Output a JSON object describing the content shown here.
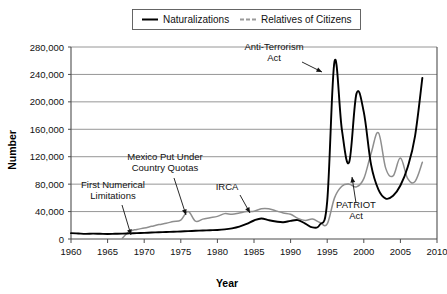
{
  "chart_data": {
    "type": "line",
    "title": "",
    "xlabel": "Year",
    "ylabel": "Number",
    "xlim": [
      1960,
      2010
    ],
    "ylim": [
      0,
      280000
    ],
    "xticks": [
      1960,
      1965,
      1970,
      1975,
      1980,
      1985,
      1990,
      1995,
      2000,
      2005,
      2010
    ],
    "xtick_labels": [
      "1960",
      "1965",
      "1970",
      "1975",
      "1980",
      "1985",
      "1990",
      "1995",
      "2000",
      "2005",
      "2010"
    ],
    "yticks": [
      0,
      40000,
      80000,
      120000,
      160000,
      200000,
      240000,
      280000
    ],
    "ytick_labels": [
      "0",
      "40,000",
      "80,000",
      "120,000",
      "160,000",
      "200,000",
      "240,000",
      "280,000"
    ],
    "grid": true,
    "legend_position": "top-center",
    "series": [
      {
        "name": "Naturalizations",
        "color": "#000000",
        "style": "solid",
        "x": [
          1960,
          1961,
          1962,
          1963,
          1964,
          1965,
          1966,
          1967,
          1968,
          1969,
          1970,
          1971,
          1972,
          1973,
          1974,
          1975,
          1976,
          1977,
          1978,
          1979,
          1980,
          1981,
          1982,
          1983,
          1984,
          1985,
          1986,
          1987,
          1988,
          1989,
          1990,
          1991,
          1992,
          1993,
          1994,
          1995,
          1996,
          1997,
          1998,
          1999,
          2000,
          2001,
          2002,
          2003,
          2004,
          2005,
          2006,
          2007,
          2008
        ],
        "values": [
          8500,
          8000,
          7500,
          7800,
          7600,
          7400,
          7600,
          7800,
          8200,
          8600,
          9000,
          9400,
          9800,
          10200,
          10600,
          11000,
          11500,
          12000,
          12400,
          12800,
          13200,
          14000,
          15500,
          18000,
          22000,
          27000,
          30000,
          27500,
          25500,
          24500,
          26500,
          27500,
          22500,
          17000,
          21000,
          55000,
          259000,
          160000,
          112000,
          212000,
          185000,
          108000,
          72000,
          59000,
          63000,
          78000,
          105000,
          150000,
          235000
        ]
      },
      {
        "name": "Relatives of Citizens",
        "color": "#8e8e8e",
        "style": "solid",
        "x": [
          1967,
          1968,
          1969,
          1970,
          1971,
          1972,
          1973,
          1974,
          1975,
          1976,
          1977,
          1978,
          1979,
          1980,
          1981,
          1982,
          1983,
          1984,
          1985,
          1986,
          1987,
          1988,
          1989,
          1990,
          1991,
          1992,
          1993,
          1994,
          1995,
          1996,
          1997,
          1998,
          1999,
          2000,
          2001,
          2002,
          2003,
          2004,
          2005,
          2006,
          2007,
          2008
        ],
        "values": [
          1000,
          11000,
          14000,
          16000,
          18500,
          21000,
          23000,
          25500,
          27500,
          40000,
          26000,
          29000,
          31000,
          33000,
          37000,
          36000,
          38000,
          40000,
          40500,
          44000,
          44000,
          41000,
          38000,
          36000,
          30000,
          27000,
          29000,
          24000,
          22000,
          60000,
          77000,
          80000,
          76000,
          88000,
          125000,
          155000,
          103000,
          92000,
          118000,
          88000,
          84000,
          112000
        ]
      }
    ],
    "annotations": [
      {
        "text_lines": [
          "Anti-Terrorism",
          "Act"
        ],
        "text_x": 274,
        "text_y": 50,
        "arrow_from": [
          302,
          62
        ],
        "arrow_to": [
          322,
          72
        ]
      },
      {
        "text_lines": [
          "Mexico  Put Under",
          "Country Quotas"
        ],
        "text_x": 165,
        "text_y": 160,
        "arrow_from": [
          174,
          178
        ],
        "arrow_to": [
          186,
          215
        ]
      },
      {
        "text_lines": [
          "First Numerical",
          "Limitations"
        ],
        "text_x": 113,
        "text_y": 188,
        "arrow_from": [
          122,
          205
        ],
        "arrow_to": [
          131,
          235
        ]
      },
      {
        "text_lines": [
          "IRCA"
        ],
        "text_x": 227,
        "text_y": 190,
        "arrow_from": [
          240,
          195
        ],
        "arrow_to": [
          250,
          213
        ]
      },
      {
        "text_lines": [
          "PATRIOT",
          "Act"
        ],
        "text_x": 356,
        "text_y": 208,
        "arrow_from": [
          356,
          203
        ],
        "arrow_to": [
          352,
          177
        ]
      }
    ]
  },
  "legend": {
    "items": [
      {
        "label": "Naturalizations",
        "swatch": "solid-black-line"
      },
      {
        "label": "Relatives of Citizens",
        "swatch": "dashed-gray-line"
      }
    ]
  },
  "colors": {
    "naturalizations": "#000000",
    "relatives": "#8e8e8e",
    "grid": "#8a8a8a",
    "axis": "#4d4d4d",
    "background": "#ffffff"
  }
}
